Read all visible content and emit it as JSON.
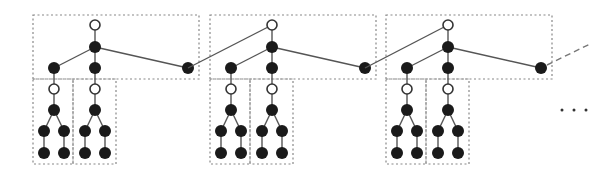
{
  "diagram": {
    "type": "chained-trees",
    "colors": {
      "filled_node": "#1a1a1a",
      "open_node_stroke": "#333333",
      "edge": "#555555",
      "box": "#888888"
    },
    "units": [
      {
        "offset": 0
      },
      {
        "offset": 177
      },
      {
        "offset": 353
      }
    ],
    "continuation": "…",
    "ellipsis_dots": 3
  }
}
